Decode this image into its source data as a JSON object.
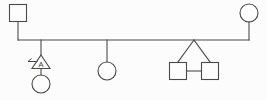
{
  "diagram": {
    "type": "genogram",
    "width": 267,
    "height": 100,
    "background_color": "#fcfcfc",
    "line_color": "#4a4a4a",
    "shape_fill_color": "#fdfdfd"
  },
  "generations": {
    "parents": {
      "label": "Parent couple",
      "father": {
        "symbol_name": "square",
        "meaning": "male",
        "label": "",
        "x": 18,
        "y": 13,
        "size": 17
      },
      "mother": {
        "symbol_name": "circle",
        "meaning": "female",
        "label": "",
        "x": 249,
        "y": 13,
        "radius": 9
      },
      "union_line": {
        "label": "partnership line",
        "y": 40,
        "x_start": 18,
        "x_end": 249
      }
    },
    "children": [
      {
        "index": 1,
        "symbol_name": "triangle",
        "meaning": "pregnancy",
        "label": "A",
        "drop_x": 41,
        "has_left_tick": true,
        "tick_label": "terminated-marker"
      },
      {
        "index": 2,
        "symbol_name": "circle",
        "meaning": "female",
        "label": "",
        "drop_x": 41,
        "attached_below": true
      },
      {
        "index": 3,
        "symbol_name": "circle",
        "meaning": "female",
        "label": "",
        "drop_x": 107
      },
      {
        "index": 4,
        "symbol_name": "square",
        "meaning": "male twin",
        "label": "",
        "drop_x": 194,
        "twin_position": "left"
      },
      {
        "index": 5,
        "symbol_name": "square",
        "meaning": "male twin",
        "label": "",
        "drop_x": 194,
        "twin_position": "right"
      }
    ],
    "twin_group": {
      "label": "monozygotic twins",
      "apex_x": 194,
      "apex_y": 40,
      "connector_label": "identical twin bar"
    }
  },
  "legend": {
    "square_meaning": "male",
    "circle_meaning": "female",
    "triangle_meaning": "pregnancy",
    "triangle_label": "A"
  }
}
